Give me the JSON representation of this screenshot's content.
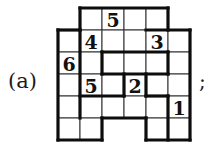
{
  "figure": {
    "label": "(a)",
    "terminator": ";",
    "grid": {
      "columns": 6,
      "rows": 6,
      "cell_size": 22,
      "origin_x": 58,
      "origin_y": 8,
      "colors": {
        "thin_line": "#3c3c3c",
        "thick_line": "#0d0d0d",
        "cell_fill": "#ffffff",
        "digit": "#111111",
        "background": "#ffffff"
      },
      "cells": [
        {
          "row": 1,
          "col": 2,
          "value": ""
        },
        {
          "row": 1,
          "col": 3,
          "value": "5"
        },
        {
          "row": 1,
          "col": 4,
          "value": ""
        },
        {
          "row": 1,
          "col": 5,
          "value": ""
        },
        {
          "row": 2,
          "col": 1,
          "value": ""
        },
        {
          "row": 2,
          "col": 2,
          "value": "4"
        },
        {
          "row": 2,
          "col": 3,
          "value": ""
        },
        {
          "row": 2,
          "col": 4,
          "value": ""
        },
        {
          "row": 2,
          "col": 5,
          "value": "3"
        },
        {
          "row": 2,
          "col": 6,
          "value": ""
        },
        {
          "row": 3,
          "col": 1,
          "value": "6"
        },
        {
          "row": 3,
          "col": 2,
          "value": ""
        },
        {
          "row": 3,
          "col": 3,
          "value": ""
        },
        {
          "row": 3,
          "col": 4,
          "value": ""
        },
        {
          "row": 3,
          "col": 5,
          "value": ""
        },
        {
          "row": 3,
          "col": 6,
          "value": ""
        },
        {
          "row": 4,
          "col": 1,
          "value": ""
        },
        {
          "row": 4,
          "col": 2,
          "value": "5"
        },
        {
          "row": 4,
          "col": 3,
          "value": ""
        },
        {
          "row": 4,
          "col": 4,
          "value": "2"
        },
        {
          "row": 4,
          "col": 5,
          "value": ""
        },
        {
          "row": 4,
          "col": 6,
          "value": ""
        },
        {
          "row": 5,
          "col": 1,
          "value": ""
        },
        {
          "row": 5,
          "col": 2,
          "value": ""
        },
        {
          "row": 5,
          "col": 3,
          "value": ""
        },
        {
          "row": 5,
          "col": 4,
          "value": ""
        },
        {
          "row": 5,
          "col": 5,
          "value": ""
        },
        {
          "row": 5,
          "col": 6,
          "value": "1"
        },
        {
          "row": 6,
          "col": 1,
          "value": ""
        },
        {
          "row": 6,
          "col": 2,
          "value": ""
        },
        {
          "row": 6,
          "col": 5,
          "value": ""
        },
        {
          "row": 6,
          "col": 6,
          "value": ""
        }
      ],
      "clues": [
        {
          "row": 1,
          "col": 3,
          "value": "5"
        },
        {
          "row": 2,
          "col": 2,
          "value": "4"
        },
        {
          "row": 2,
          "col": 5,
          "value": "3"
        },
        {
          "row": 3,
          "col": 1,
          "value": "6"
        },
        {
          "row": 4,
          "col": 2,
          "value": "5"
        },
        {
          "row": 4,
          "col": 4,
          "value": "2"
        },
        {
          "row": 5,
          "col": 6,
          "value": "1"
        }
      ],
      "thick_segments_h": [
        {
          "row": 1,
          "col_start": 2,
          "col_end": 6
        },
        {
          "row": 2,
          "col_start": 1,
          "col_end": 2
        },
        {
          "row": 2,
          "col_start": 5,
          "col_end": 7
        },
        {
          "row": 3,
          "col_start": 3,
          "col_end": 6
        },
        {
          "row": 4,
          "col_start": 3,
          "col_end": 6
        },
        {
          "row": 5,
          "col_start": 2,
          "col_end": 4
        },
        {
          "row": 5,
          "col_start": 5,
          "col_end": 6
        },
        {
          "row": 6,
          "col_start": 3,
          "col_end": 5
        },
        {
          "row": 7,
          "col_start": 1,
          "col_end": 3
        },
        {
          "row": 7,
          "col_start": 5,
          "col_end": 7
        }
      ],
      "thick_segments_v": [
        {
          "col": 2,
          "row_start": 1,
          "row_end": 2
        },
        {
          "col": 6,
          "row_start": 1,
          "row_end": 2
        },
        {
          "col": 1,
          "row_start": 2,
          "row_end": 7
        },
        {
          "col": 2,
          "row_start": 2,
          "row_end": 6
        },
        {
          "col": 7,
          "row_start": 2,
          "row_end": 7
        },
        {
          "col": 3,
          "row_start": 3,
          "row_end": 4
        },
        {
          "col": 6,
          "row_start": 3,
          "row_end": 4
        },
        {
          "col": 4,
          "row_start": 4,
          "row_end": 5
        },
        {
          "col": 5,
          "row_start": 4,
          "row_end": 5
        },
        {
          "col": 3,
          "row_start": 6,
          "row_end": 7
        },
        {
          "col": 5,
          "row_start": 6,
          "row_end": 7
        },
        {
          "col": 6,
          "row_start": 5,
          "row_end": 7
        }
      ]
    }
  }
}
